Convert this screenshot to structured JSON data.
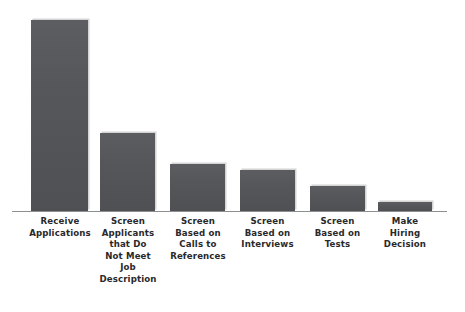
{
  "chart_data": {
    "type": "bar",
    "title": "",
    "subtitle": "",
    "xlabel": "",
    "ylabel": "",
    "orientation": "vertical",
    "grid": false,
    "legend": null,
    "axis": {
      "x_line_visible": true,
      "y_axis_visible": false,
      "y_tick_labels": [],
      "x_tick_labels_position": "below-axis"
    },
    "bar_color": "#55575A",
    "bar_edge_shadow_color": "#CDCDCD",
    "background_color": "#FFFFFF",
    "label_color": "#29292B",
    "axis_line_color": "#8D8F91",
    "categories": [
      "Receive\nApplications",
      "Screen\nApplicants\nthat Do\nNot Meet\nJob\nDescription",
      "Screen\nBased on\nCalls to\nReferences",
      "Screen\nBased on\nInterviews",
      "Screen\nBased on\nTests",
      "Make\nHiring\nDecision"
    ],
    "values": [
      191,
      78,
      47,
      41,
      25,
      9
    ],
    "value_unit": "relative pixel height (no numeric axis shown)",
    "ylim": [
      0,
      200
    ]
  },
  "bars": [
    {
      "label": "Receive\nApplications",
      "value": 191,
      "x": 31,
      "width": 57,
      "label_left": 14,
      "label_width": 92
    },
    {
      "label": "Screen\nApplicants\nthat Do\nNot Meet\nJob\nDescription",
      "value": 78,
      "x": 100,
      "width": 55,
      "label_left": 92,
      "label_width": 72
    },
    {
      "label": "Screen\nBased on\nCalls to\nReferences",
      "value": 47,
      "x": 170,
      "width": 55,
      "label_left": 160,
      "label_width": 76
    },
    {
      "label": "Screen\nBased on\nInterviews",
      "value": 41,
      "x": 240,
      "width": 55,
      "label_left": 229,
      "label_width": 77
    },
    {
      "label": "Screen\nBased on\nTests",
      "value": 25,
      "x": 310,
      "width": 55,
      "label_left": 299,
      "label_width": 77
    },
    {
      "label": "Make\nHiring\nDecision",
      "value": 9,
      "x": 378,
      "width": 54,
      "label_left": 368,
      "label_width": 74
    }
  ]
}
